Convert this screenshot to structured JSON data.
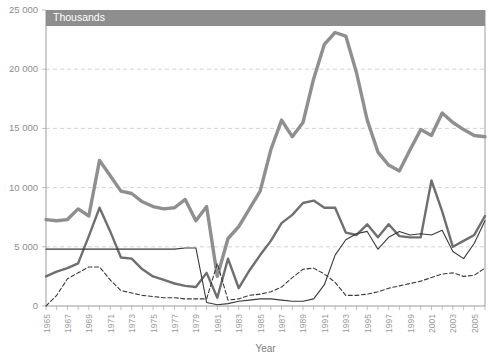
{
  "banner": {
    "label": "Thousands"
  },
  "axes": {
    "x_title": "Year",
    "y_ticks": [
      "0",
      "5 000",
      "10 000",
      "15 000",
      "20 000",
      "25 000"
    ],
    "x_ticks": [
      "1965",
      "1967",
      "1969",
      "1971",
      "1973",
      "1975",
      "1977",
      "1979",
      "1981",
      "1983",
      "1985",
      "1987",
      "1989",
      "1991",
      "1993",
      "1995",
      "1997",
      "1999",
      "2001",
      "2003",
      "2005"
    ]
  },
  "colors": {
    "series_thick_gray": "#8f8f8f",
    "series_medium_gray": "#6f6f6f",
    "series_thin_black": "#3a3a3a",
    "series_dashed_black": "#3a3a3a",
    "gridline": "#c9c9c9",
    "axis": "#9b9b9b",
    "banner": "#8e8e8e",
    "tick_text": "#8d8d8d"
  },
  "chart_data": {
    "type": "line",
    "title": "",
    "subtitle": "Thousands",
    "xlabel": "Year",
    "ylabel": "Thousands",
    "xlim": [
      1965,
      2006
    ],
    "ylim": [
      0,
      25000
    ],
    "grid": true,
    "legend": "none",
    "x": [
      1965,
      1966,
      1967,
      1968,
      1969,
      1970,
      1971,
      1972,
      1973,
      1974,
      1975,
      1976,
      1977,
      1978,
      1979,
      1980,
      1981,
      1982,
      1983,
      1984,
      1985,
      1986,
      1987,
      1988,
      1989,
      1990,
      1991,
      1992,
      1993,
      1994,
      1995,
      1996,
      1997,
      1998,
      1999,
      2000,
      2001,
      2002,
      2003,
      2004,
      2005,
      2006
    ],
    "series": [
      {
        "name": "series-1-thick-gray",
        "style": "solid-thick",
        "values": [
          7300,
          7200,
          7300,
          8200,
          7600,
          12300,
          11000,
          9700,
          9500,
          8800,
          8400,
          8200,
          8300,
          9000,
          7200,
          8400,
          2500,
          5700,
          6700,
          8200,
          9700,
          13200,
          15700,
          14300,
          15500,
          19200,
          22100,
          23100,
          22800,
          19700,
          15700,
          13000,
          11900,
          11400,
          13200,
          14900,
          14400,
          16300,
          15500,
          14900,
          14400,
          14300
        ]
      },
      {
        "name": "series-2-medium-gray",
        "style": "solid-medium",
        "values": [
          2500,
          2900,
          3200,
          3600,
          5900,
          8300,
          6300,
          4100,
          4000,
          3100,
          2500,
          2200,
          1900,
          1700,
          1600,
          2800,
          700,
          4000,
          1500,
          3000,
          4300,
          5500,
          7000,
          7700,
          8700,
          8900,
          8300,
          8300,
          6200,
          6000,
          6900,
          5800,
          6900,
          5900,
          5800,
          5800,
          10600,
          8000,
          5000,
          5500,
          6000,
          7600
        ]
      },
      {
        "name": "series-3-thin-black",
        "style": "solid-thin",
        "values": [
          4800,
          4800,
          4800,
          4800,
          4800,
          4800,
          4800,
          4800,
          4800,
          4800,
          4800,
          4800,
          4800,
          4900,
          4900,
          300,
          100,
          200,
          400,
          500,
          600,
          600,
          500,
          400,
          400,
          600,
          1800,
          4300,
          5600,
          6100,
          6300,
          4800,
          5800,
          6300,
          6000,
          6100,
          6000,
          6400,
          4600,
          4000,
          5300,
          7200
        ]
      },
      {
        "name": "series-4-dashed-black",
        "style": "dashed",
        "values": [
          0,
          900,
          2300,
          2800,
          3300,
          3300,
          2200,
          1300,
          1100,
          900,
          800,
          700,
          700,
          600,
          600,
          600,
          3600,
          500,
          600,
          900,
          1000,
          1200,
          1600,
          2400,
          3100,
          3200,
          2700,
          2000,
          900,
          900,
          1000,
          1200,
          1500,
          1700,
          1900,
          2100,
          2400,
          2700,
          2800,
          2500,
          2600,
          3200
        ]
      }
    ]
  }
}
